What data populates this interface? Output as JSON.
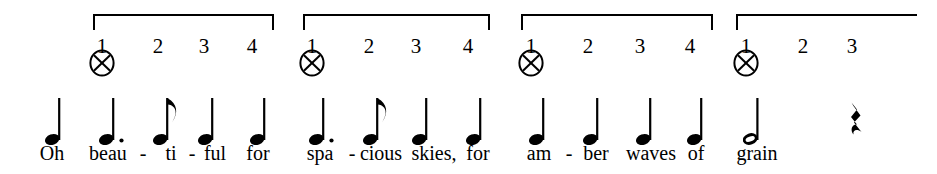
{
  "sheet": {
    "title": "America the Beautiful - rhythm notation with counted beats",
    "ink_color": "#000000",
    "background_color": "#ffffff",
    "width": 937,
    "height": 174
  },
  "measures": [
    {
      "index": 1,
      "bracket": {
        "x": 93,
        "y": 14,
        "width": 181,
        "closed": true
      },
      "beats": [
        {
          "label": "1",
          "x": 102,
          "accent_icon": "circled-x-icon",
          "accented": true
        },
        {
          "label": "2",
          "x": 158,
          "accented": false
        },
        {
          "label": "3",
          "x": 204,
          "accented": false
        },
        {
          "label": "4",
          "x": 252,
          "accented": false
        }
      ],
      "notes": [
        {
          "glyph": "quarter-note",
          "x": 52,
          "lyric": "Oh",
          "lyric_x": 52
        },
        {
          "glyph": "dotted-quarter-note",
          "x": 106,
          "lyric": "beau",
          "lyric_x": 108
        },
        {
          "glyph": "eighth-note",
          "x": 160,
          "lyric": "ti",
          "lyric_x": 171
        },
        {
          "glyph": "quarter-note",
          "x": 205,
          "lyric": "ful",
          "lyric_x": 215
        },
        {
          "glyph": "quarter-note",
          "x": 257,
          "lyric": "for",
          "lyric_x": 258
        }
      ],
      "hyphens": [
        {
          "x": 143
        },
        {
          "x": 192
        }
      ]
    },
    {
      "index": 2,
      "bracket": {
        "x": 303,
        "y": 14,
        "width": 187,
        "closed": true
      },
      "beats": [
        {
          "label": "1",
          "x": 312,
          "accent_icon": "circled-x-icon",
          "accented": true
        },
        {
          "label": "2",
          "x": 369,
          "accented": false
        },
        {
          "label": "3",
          "x": 416,
          "accented": false
        },
        {
          "label": "4",
          "x": 468,
          "accented": false
        }
      ],
      "notes": [
        {
          "glyph": "dotted-quarter-note",
          "x": 316,
          "lyric": "spa",
          "lyric_x": 320
        },
        {
          "glyph": "eighth-note",
          "x": 370,
          "lyric": "cious",
          "lyric_x": 381
        },
        {
          "glyph": "quarter-note",
          "x": 419,
          "lyric": "skies,",
          "lyric_x": 434
        },
        {
          "glyph": "quarter-note",
          "x": 473,
          "lyric": "for",
          "lyric_x": 478
        }
      ],
      "hyphens": [
        {
          "x": 352
        }
      ]
    },
    {
      "index": 3,
      "bracket": {
        "x": 521,
        "y": 14,
        "width": 192,
        "closed": true
      },
      "beats": [
        {
          "label": "1",
          "x": 531,
          "accent_icon": "circled-x-icon",
          "accented": true
        },
        {
          "label": "2",
          "x": 588,
          "accented": false
        },
        {
          "label": "3",
          "x": 640,
          "accented": false
        },
        {
          "label": "4",
          "x": 690,
          "accented": false
        }
      ],
      "notes": [
        {
          "glyph": "quarter-note",
          "x": 536,
          "lyric": "am",
          "lyric_x": 539
        },
        {
          "glyph": "quarter-note",
          "x": 590,
          "lyric": "ber",
          "lyric_x": 596
        },
        {
          "glyph": "quarter-note",
          "x": 643,
          "lyric": "waves",
          "lyric_x": 651
        },
        {
          "glyph": "quarter-note",
          "x": 694,
          "lyric": "of",
          "lyric_x": 696
        }
      ],
      "hyphens": [
        {
          "x": 569
        }
      ]
    },
    {
      "index": 4,
      "bracket": {
        "x": 736,
        "y": 14,
        "width": 181,
        "closed": false
      },
      "beats": [
        {
          "label": "1",
          "x": 746,
          "accent_icon": "circled-x-icon",
          "accented": true
        },
        {
          "label": "2",
          "x": 803,
          "accented": false
        },
        {
          "label": "3",
          "x": 852,
          "accented": false
        }
      ],
      "notes": [
        {
          "glyph": "half-note",
          "x": 750,
          "lyric": "grain",
          "lyric_x": 757
        },
        {
          "glyph": "quarter-rest",
          "x": 855,
          "lyric": "",
          "lyric_x": 0
        }
      ],
      "hyphens": []
    }
  ],
  "glyph_names": {
    "quarter-note": "quarter-note-glyph",
    "dotted-quarter-note": "dotted-quarter-note-glyph",
    "eighth-note": "eighth-note-glyph",
    "half-note": "half-note-glyph",
    "quarter-rest": "quarter-rest-glyph",
    "circled-x": "circled-x-icon"
  }
}
